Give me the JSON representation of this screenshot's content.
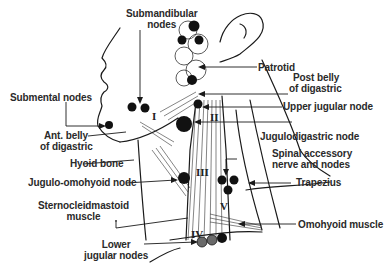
{
  "figure": {
    "labels": {
      "submandibular": [
        "Submandibular",
        "nodes"
      ],
      "patrotid": "Patrotid",
      "post_belly": [
        "Post belly",
        "of digastric"
      ],
      "upper_jugular": "Upper jugular node",
      "submental": "Submental nodes",
      "jugulodigastric": "Jugulodigastric node",
      "ant_belly": [
        "Ant. belly",
        "of digastric"
      ],
      "hyoid": "Hyoid bone",
      "spinal_accessory": [
        "Spinal accessory",
        "nerve and nodes"
      ],
      "trapezius": "Trapezius",
      "jugulo_omohyoid": "Jugulo-omohyoid node",
      "sternocleidomastoid": [
        "Sternocleidmastoid",
        "muscle"
      ],
      "omohyoid": "Omohyoid muscle",
      "lower_jugular": [
        "Lower",
        "jugular nodes"
      ]
    },
    "regions": {
      "I": "I",
      "II": "II",
      "III": "III",
      "IV": "IV",
      "V": "V"
    },
    "colors": {
      "ink": "#1a1a1a",
      "node_dark": "#111111",
      "node_gray": "#6a6a6a",
      "background": "#ffffff"
    }
  }
}
